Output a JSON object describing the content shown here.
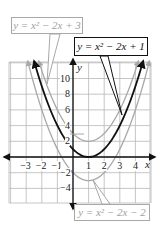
{
  "figure": {
    "axes": {
      "x_label": "x",
      "y_label": "y",
      "x_ticks": [
        "−3",
        "−2",
        "−1",
        "1",
        "2",
        "3",
        "4"
      ],
      "y_ticks": [
        "10",
        "8",
        "6",
        "4",
        "2",
        "−2",
        "−4"
      ]
    },
    "labels": {
      "upper": "y = x² − 2x + 3",
      "middle": "y = x² − 2x + 1",
      "lower": "y = x² − 2x − 2"
    },
    "colors": {
      "highlight": "#111111",
      "muted": "#a8a8a8",
      "grid": "#b8b8b8"
    }
  },
  "chart_data": {
    "type": "line",
    "title": "",
    "xlabel": "x",
    "ylabel": "y",
    "xlim": [
      -4,
      5
    ],
    "ylim": [
      -6,
      12
    ],
    "grid": true,
    "x_tick_labels": [
      -3,
      -2,
      -1,
      1,
      2,
      3,
      4
    ],
    "y_tick_labels": [
      10,
      8,
      6,
      4,
      2,
      -2,
      -4
    ],
    "series": [
      {
        "name": "y = x^2 - 2x + 3",
        "style": "gray",
        "vertex": [
          1,
          2
        ],
        "x": [
          -2,
          -1,
          0,
          1,
          2,
          3,
          4
        ],
        "y": [
          11,
          6,
          3,
          2,
          3,
          6,
          11
        ]
      },
      {
        "name": "y = x^2 - 2x + 1",
        "style": "black",
        "vertex": [
          1,
          0
        ],
        "x": [
          -2,
          -1,
          0,
          1,
          2,
          3,
          4
        ],
        "y": [
          9,
          4,
          1,
          0,
          1,
          4,
          9
        ]
      },
      {
        "name": "y = x^2 - 2x - 2",
        "style": "gray",
        "vertex": [
          1,
          -3
        ],
        "x": [
          -2,
          -1,
          0,
          1,
          2,
          3,
          4
        ],
        "y": [
          6,
          1,
          -2,
          -3,
          -2,
          1,
          6
        ]
      }
    ]
  }
}
